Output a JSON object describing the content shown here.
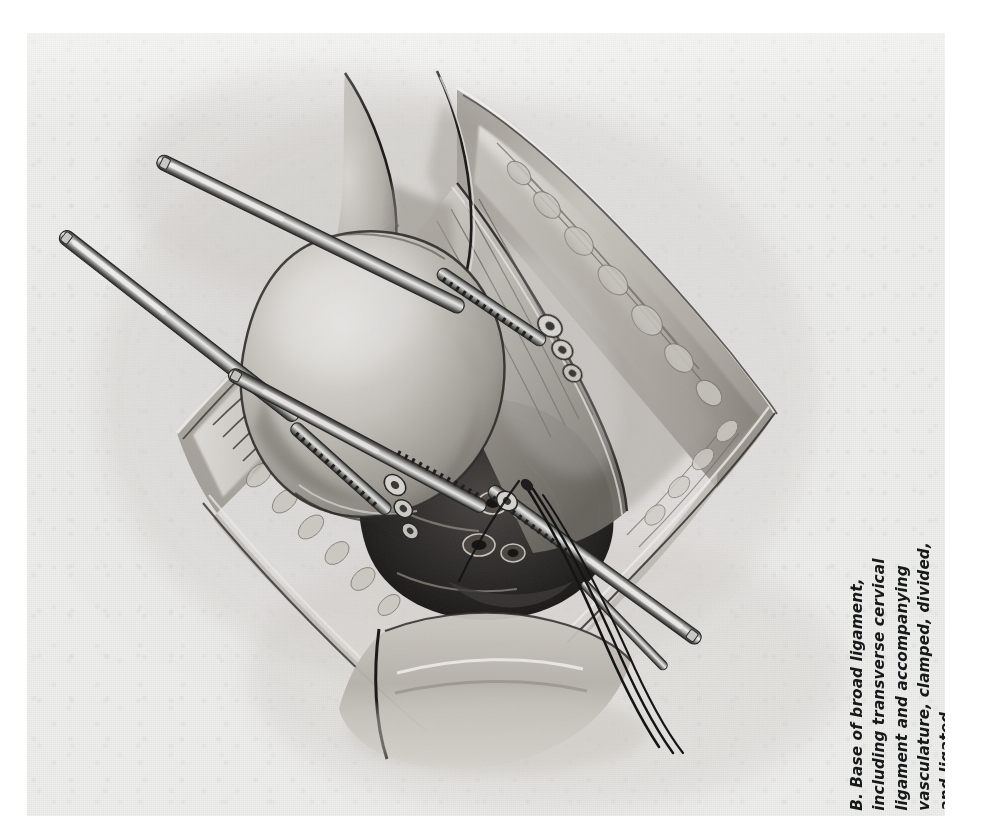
{
  "plate": {
    "label": "B.",
    "caption_lines": [
      "B.  Base of broad ligament,",
      "including transverse cervical",
      "ligament and accompanying",
      "vasculature, clamped, divided,",
      "and ligated."
    ],
    "caption_full": "B.  Base of broad ligament, including transverse cervical ligament and accompanying vasculature, clamped, divided, and ligated.",
    "orientation": "rotated-90-ccw",
    "background_color": "#f1f1ef",
    "ink_color": "#17181a",
    "medium": "grayscale airbrush and pencil medical illustration"
  },
  "illustration": {
    "title": "Base of broad ligament clamped, divided and ligated",
    "view": "open abdominal surgical field, diamond-shaped incision",
    "palette": {
      "paper": "#f1f1ef",
      "tissue_light": "#dedcd8",
      "tissue_mid": "#b4b0aa",
      "tissue_dark": "#6e6a65",
      "tissue_deep": "#2e2c2a",
      "steel_light": "#e6e6e4",
      "steel_mid": "#9a9a98",
      "steel_dark": "#3a3a3a",
      "suture": "#141414"
    },
    "elements": [
      {
        "name": "incision-edge-right",
        "kind": "abdominal-wall",
        "note": "retracted wound edge with subcutaneous fat lobules"
      },
      {
        "name": "incision-edge-left",
        "kind": "abdominal-wall",
        "note": "retracted wound edge with subcutaneous fat lobules"
      },
      {
        "name": "uterine-corpus",
        "kind": "organ",
        "note": "large rounded body of uterus, upper-left of field"
      },
      {
        "name": "broad-ligament-base",
        "kind": "ligament",
        "note": "transverse cervical (cardinal) ligament at base"
      },
      {
        "name": "cervix-region",
        "kind": "organ",
        "note": "deep dark pelvic tissue, cut pedicles"
      },
      {
        "name": "clamp-upper-left",
        "kind": "instrument",
        "label": "hemostatic clamp"
      },
      {
        "name": "clamp-mid-left",
        "kind": "instrument",
        "label": "hemostatic clamp"
      },
      {
        "name": "clamp-lower-left",
        "kind": "instrument",
        "label": "hemostatic clamp"
      },
      {
        "name": "clamp-lower-right",
        "kind": "instrument",
        "label": "hemostatic clamp"
      },
      {
        "name": "ligature-sutures",
        "kind": "suture",
        "count": 3,
        "note": "free suture ends trailing to lower right"
      },
      {
        "name": "vascular-pedicles",
        "kind": "vessels",
        "note": "clamped and divided uterine vasculature"
      }
    ]
  }
}
